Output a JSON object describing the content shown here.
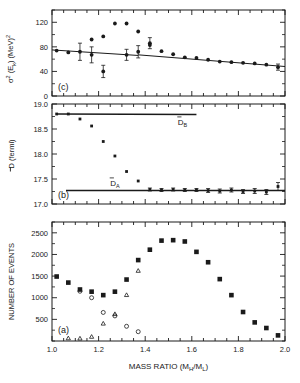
{
  "figure": {
    "title": "",
    "background_color": "#ffffff",
    "ink_color": "#1a1a1a",
    "xlabel": "MASS RATIO (M",
    "xlabel_sub1": "H",
    "xlabel_mid": "/M",
    "xlabel_sub2": "L",
    "xlabel_end": ")",
    "xlabel_full": "MASS RATIO (MH/ML)"
  },
  "panel_c": {
    "tag": "(c)",
    "ylabel_sigma": "σ",
    "ylabel_sup": "2",
    "ylabel_rest": " (E",
    "ylabel_sub": "k",
    "ylabel_tail": ") (MeV)",
    "ylabel_tail_sup": "2",
    "ylabel_full": "σ² (Ek) (MeV)²",
    "yticks": [
      "0",
      "40",
      "80",
      "120"
    ],
    "ylim": [
      0,
      140
    ]
  },
  "panel_b": {
    "tag": "(b)",
    "ylabel_bar": "D",
    "ylabel_rest": " (fermi)",
    "ylabel_full": "D̅ (fermi)",
    "yticks": [
      "17.0",
      "17.5",
      "18.0",
      "18.5",
      "19.0"
    ],
    "ylim": [
      17.0,
      19.0
    ],
    "line_b_label": "D",
    "line_b_sub": "B",
    "line_a_label": "D",
    "line_a_sub": "A"
  },
  "panel_a": {
    "tag": "(a)",
    "ylabel_full": "NUMBER OF EVENTS",
    "yticks": [
      "500",
      "1000",
      "1500",
      "2000",
      "2500"
    ],
    "ylim": [
      0,
      2750
    ]
  },
  "xaxis": {
    "ticks": [
      "1.0",
      "1.2",
      "1.4",
      "1.6",
      "1.8",
      "2.0"
    ],
    "xlim": [
      1.0,
      2.0
    ]
  },
  "chart_data": [
    {
      "type": "scatter",
      "panel": "c",
      "title": "",
      "xlabel": "MASS RATIO (MH/ML)",
      "ylabel": "σ² (Ek) (MeV)²",
      "xlim": [
        1.0,
        2.0
      ],
      "ylim": [
        0,
        140
      ],
      "grid": false,
      "legend": "none",
      "series": [
        {
          "name": "sigma-squared-data",
          "marker": "filled-circle",
          "x": [
            1.02,
            1.07,
            1.12,
            1.17,
            1.17,
            1.22,
            1.22,
            1.27,
            1.32,
            1.32,
            1.37,
            1.37,
            1.42,
            1.42,
            1.47,
            1.52,
            1.57,
            1.62,
            1.67,
            1.72,
            1.77,
            1.82,
            1.87,
            1.92,
            1.97
          ],
          "y": [
            74,
            71,
            72,
            92,
            67,
            97,
            40,
            118,
            118,
            67,
            105,
            72,
            86,
            83,
            73,
            68,
            63,
            62,
            59,
            56,
            55,
            54,
            53,
            51,
            47
          ],
          "yerr": [
            0,
            0,
            14,
            0,
            13,
            0,
            10,
            0,
            0,
            9,
            0,
            10,
            9,
            0,
            0,
            0,
            0,
            0,
            0,
            0,
            0,
            0,
            0,
            0,
            5
          ]
        }
      ],
      "lines": [
        {
          "name": "trend-line-left",
          "x": [
            1.0,
            1.37
          ],
          "y": [
            75,
            66
          ]
        },
        {
          "name": "trend-line-right",
          "x": [
            1.37,
            2.0
          ],
          "y": [
            67,
            48
          ]
        }
      ]
    },
    {
      "type": "scatter",
      "panel": "b",
      "title": "",
      "xlabel": "MASS RATIO (MH/ML)",
      "ylabel": "D̅ (fermi)",
      "xlim": [
        1.0,
        2.0
      ],
      "ylim": [
        17.0,
        19.0
      ],
      "grid": false,
      "legend": "none",
      "series": [
        {
          "name": "mean-separation-data",
          "marker": "filled-square",
          "x": [
            1.02,
            1.07,
            1.12,
            1.17,
            1.22,
            1.27,
            1.32,
            1.37,
            1.42,
            1.47,
            1.52,
            1.57,
            1.62,
            1.67,
            1.72,
            1.77,
            1.82,
            1.87,
            1.92,
            1.97
          ],
          "y": [
            18.8,
            18.8,
            18.7,
            18.56,
            18.25,
            17.96,
            17.65,
            17.46,
            17.29,
            17.28,
            17.29,
            17.28,
            17.28,
            17.27,
            17.26,
            17.28,
            17.25,
            17.26,
            17.24,
            17.35
          ],
          "yerr": [
            0.02,
            0.02,
            0.02,
            0.02,
            0.02,
            0.02,
            0.02,
            0.02,
            0.03,
            0.03,
            0.03,
            0.03,
            0.03,
            0.04,
            0.04,
            0.04,
            0.04,
            0.05,
            0.05,
            0.08
          ]
        }
      ],
      "lines": [
        {
          "name": "D-bar-B-line",
          "label": "D̅B",
          "x": [
            1.02,
            1.62
          ],
          "y": [
            18.8,
            18.79
          ]
        },
        {
          "name": "D-bar-A-line",
          "label": "D̅A",
          "x": [
            1.06,
            2.0
          ],
          "y": [
            17.27,
            17.27
          ]
        }
      ]
    },
    {
      "type": "scatter",
      "panel": "a",
      "title": "",
      "xlabel": "MASS RATIO (MH/ML)",
      "ylabel": "NUMBER OF EVENTS",
      "xlim": [
        1.0,
        2.0
      ],
      "ylim": [
        0,
        2750
      ],
      "grid": false,
      "legend": "none",
      "series": [
        {
          "name": "total-events-squares",
          "marker": "filled-square",
          "x": [
            1.02,
            1.07,
            1.12,
            1.17,
            1.22,
            1.27,
            1.32,
            1.37,
            1.42,
            1.47,
            1.52,
            1.57,
            1.62,
            1.67,
            1.72,
            1.77,
            1.82,
            1.87,
            1.92,
            1.97
          ],
          "y": [
            1490,
            1350,
            1190,
            1140,
            1060,
            1140,
            1420,
            1870,
            2110,
            2320,
            2330,
            2300,
            2060,
            1820,
            1430,
            1060,
            670,
            430,
            300,
            130
          ]
        },
        {
          "name": "component-events-circles",
          "marker": "open-circle",
          "x": [
            1.12,
            1.17,
            1.22,
            1.27,
            1.32,
            1.37
          ],
          "y": [
            1150,
            1000,
            660,
            580,
            340,
            215
          ]
        },
        {
          "name": "component-events-triangles",
          "marker": "open-triangle",
          "x": [
            1.07,
            1.12,
            1.17,
            1.22,
            1.27,
            1.32,
            1.37
          ],
          "y": [
            60,
            55,
            95,
            400,
            620,
            1060,
            1620
          ]
        }
      ]
    }
  ]
}
